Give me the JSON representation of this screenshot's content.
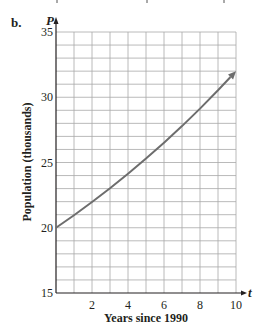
{
  "part_label": "b.",
  "chart_data": {
    "type": "line",
    "title": "",
    "xlabel": "Years since 1990",
    "ylabel": "Population (thousands)",
    "x_axis_var": "t",
    "y_axis_var": "P",
    "xlim": [
      0,
      10
    ],
    "ylim": [
      15,
      35
    ],
    "x_ticks": [
      2,
      4,
      6,
      8,
      10
    ],
    "y_ticks": [
      15,
      20,
      25,
      30,
      35
    ],
    "grid": true,
    "grid_x_step": 1,
    "grid_y_step": 1,
    "series": [
      {
        "name": "P(t)",
        "x": [
          0,
          1,
          2,
          3,
          4,
          5,
          6,
          7,
          8,
          9,
          10
        ],
        "values": [
          20,
          20.96,
          21.97,
          23.03,
          24.14,
          25.3,
          26.52,
          27.79,
          29.13,
          30.53,
          32
        ],
        "arrow_end": true,
        "color": "#707070"
      }
    ]
  }
}
